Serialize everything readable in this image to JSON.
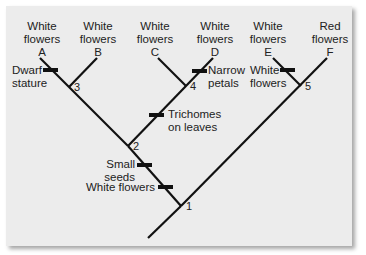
{
  "diagram": {
    "type": "cladogram",
    "colors": {
      "background": "#ececec",
      "line": "#111111",
      "text": "#222222"
    },
    "taxa": [
      {
        "id": "A",
        "trait_line1": "White",
        "trait_line2": "flowers"
      },
      {
        "id": "B",
        "trait_line1": "White",
        "trait_line2": "flowers"
      },
      {
        "id": "C",
        "trait_line1": "White",
        "trait_line2": "flowers"
      },
      {
        "id": "D",
        "trait_line1": "White",
        "trait_line2": "flowers"
      },
      {
        "id": "E",
        "trait_line1": "White",
        "trait_line2": "flowers"
      },
      {
        "id": "F",
        "trait_line1": "Red",
        "trait_line2": "flowers"
      }
    ],
    "nodes": [
      "1",
      "2",
      "3",
      "4",
      "5"
    ],
    "characters": {
      "dwarf": {
        "line1": "Dwarf",
        "line2": "stature"
      },
      "narrow": {
        "line1": "Narrow",
        "line2": "petals"
      },
      "white_e": {
        "line1": "White",
        "line2": "flowers"
      },
      "trichomes": {
        "line1": "Trichomes",
        "line2": "on leaves"
      },
      "small_seeds": {
        "text": "Small seeds"
      },
      "white_flowers": {
        "text": "White flowers"
      }
    }
  }
}
